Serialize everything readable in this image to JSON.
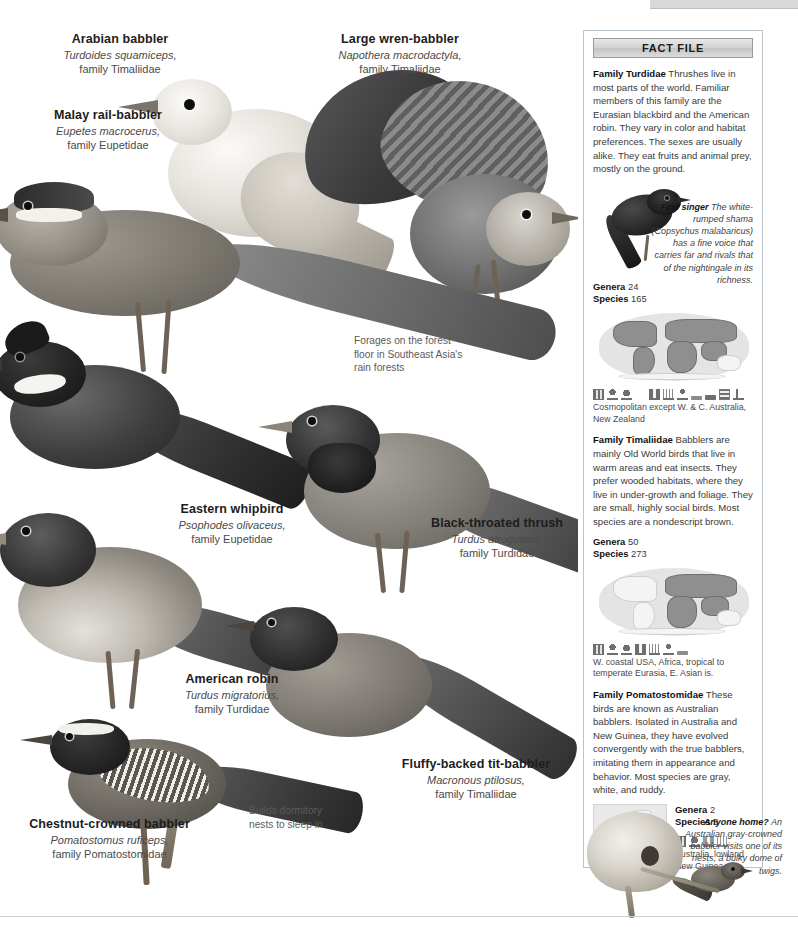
{
  "labels": [
    {
      "id": "arabian-babbler",
      "common": "Arabian babbler",
      "scientific": "Turdoides squamiceps,",
      "family": "family Timaliidae"
    },
    {
      "id": "large-wren-babbler",
      "common": "Large wren-babbler",
      "scientific": "Napothera macrodactyla,",
      "family": "family Timaliidae"
    },
    {
      "id": "malay-rail-babbler",
      "common": "Malay rail-babbler",
      "scientific": "Eupetes macrocerus,",
      "family": "family Eupetidae"
    },
    {
      "id": "eastern-whipbird",
      "common": "Eastern whipbird",
      "scientific": "Psophodes olivaceus,",
      "family": "family Eupetidae"
    },
    {
      "id": "black-throated-thrush",
      "common": "Black-throated thrush",
      "scientific": "Turdus atrogularis,",
      "family": "family Turdidae"
    },
    {
      "id": "american-robin",
      "common": "American robin",
      "scientific": "Turdus migratorius,",
      "family": "family Turdidae"
    },
    {
      "id": "fluffy-backed-tit-babbler",
      "common": "Fluffy-backed tit-babbler",
      "scientific": "Macronous ptilosus,",
      "family": "family Timaliidae"
    },
    {
      "id": "chestnut-crowned-babbler",
      "common": "Chestnut-crowned babbler",
      "scientific": "Pomatostomus ruficeps,",
      "family": "family Pomatostomidae"
    }
  ],
  "notes": [
    {
      "id": "forages-note",
      "text": "Forages on the forest floor in Southeast Asia's rain forests"
    },
    {
      "id": "dormitory-note",
      "text": "Builds dormitory nests to sleep in"
    }
  ],
  "factfile": {
    "header": "FACT FILE",
    "sections": [
      {
        "id": "turdidae",
        "family_name": "Family Turdidae",
        "body": "Thrushes live in most parts of the world. Familiar members of this family are the Eurasian blackbird and the American robin. They vary in color and habitat preferences. The sexes are usually alike. They eat fruits and animal prey, mostly on the ground.",
        "caption": {
          "title": "Fine singer",
          "text": "The white-rumped shama (Copsychus malabaricus) has a fine voice that carries far and rivals that of the nightingale in its richness."
        },
        "genera_label": "Genera",
        "genera_value": "24",
        "species_label": "Species",
        "species_value": "165",
        "icon_count": 11,
        "range": "Cosmopolitan except W. & C. Australia, New Zealand"
      },
      {
        "id": "timaliidae",
        "family_name": "Family Timaliidae",
        "body": "Babblers are mainly Old World birds that live in warm areas and eat insects. They prefer wooded habitats, where they live in under-growth and foliage. They are small, highly social birds. Most species are a nondescript brown.",
        "genera_label": "Genera",
        "genera_value": "50",
        "species_label": "Species",
        "species_value": "273",
        "icon_count": 7,
        "range": "W. coastal USA, Africa, tropical to temperate Eurasia, E. Asian is."
      },
      {
        "id": "pomatostomidae",
        "family_name": "Family Pomatostomidae",
        "body": "These birds are known as Australian babblers. Isolated in Australia and New Guinea, they have evolved convergently with the true babblers, imitating them in appearance and behavior. Most species are gray, white, and ruddy.",
        "genera_label": "Genera",
        "genera_value": "2",
        "species_label": "Species",
        "species_value": "5",
        "icon_count": 4,
        "range": "Australia, lowland New Guinea"
      }
    ],
    "nest_caption": {
      "title": "Anyone home?",
      "text": "An Australian gray-crowned babbler visits one of its nests, a bulky dome of twigs."
    }
  },
  "colors": {
    "panel_border": "#b9c4cf",
    "header_gradient_top": "#e9e9e9",
    "header_gradient_bottom": "#c4c4c4",
    "map_highlight": "#8f8f8f",
    "map_ocean": "#e4e4e4",
    "body_text": "#3a3a3a",
    "heading_text": "#111111"
  }
}
